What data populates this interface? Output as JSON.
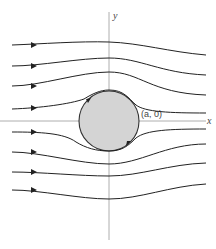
{
  "diagram": {
    "axes": {
      "x_label": "x",
      "y_label": "y",
      "origin": [
        109,
        121
      ]
    },
    "cylinder": {
      "center": [
        109,
        121
      ],
      "radius": 30,
      "fill": "#d4d4d4",
      "stroke": "#333333",
      "point_label": "(a, 0)",
      "circulation_arrows": "clockwise"
    },
    "streamlines": [
      {
        "id": "s1",
        "y_left": 45,
        "y_axis": 42,
        "y_right": 55
      },
      {
        "id": "s2",
        "y_left": 66,
        "y_axis": 58,
        "y_right": 75
      },
      {
        "id": "s3",
        "y_left": 86,
        "y_axis": 72,
        "y_right": 95
      },
      {
        "id": "s4",
        "y_left": 109,
        "y_axis": 90,
        "y_right": 113
      },
      {
        "id": "s5",
        "y_left": 132,
        "y_axis": 151,
        "y_right": 129
      },
      {
        "id": "s6",
        "y_left": 152,
        "y_axis": 164,
        "y_right": 144
      },
      {
        "id": "s7",
        "y_left": 172,
        "y_axis": 176,
        "y_right": 163
      },
      {
        "id": "s8",
        "y_left": 190,
        "y_axis": 199,
        "y_right": 184
      }
    ],
    "colors": {
      "line": "#222222",
      "axis": "#888888",
      "cylinder_fill": "#d4d4d4"
    }
  }
}
